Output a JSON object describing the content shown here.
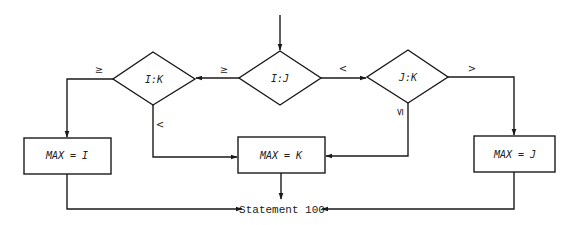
{
  "diagram": {
    "type": "flowchart",
    "decisions": [
      {
        "id": "ij",
        "label": "I:J"
      },
      {
        "id": "ik",
        "label": "I:K"
      },
      {
        "id": "jk",
        "label": "J:K"
      }
    ],
    "processes": [
      {
        "id": "max_i",
        "label": "MAX = I"
      },
      {
        "id": "max_k",
        "label": "MAX = K"
      },
      {
        "id": "max_j",
        "label": "MAX = J"
      }
    ],
    "terminal": {
      "id": "stmt100",
      "label": "Statement 100"
    },
    "edge_labels": {
      "ij_to_ik": "≥",
      "ij_to_jk": "<",
      "ik_to_max_i": "≥",
      "ik_to_max_k": "<",
      "jk_to_max_j": ">",
      "jk_to_max_k": "≤"
    },
    "edges": [
      {
        "from": "entry",
        "to": "ij"
      },
      {
        "from": "ij",
        "to": "ik",
        "label": "≥"
      },
      {
        "from": "ij",
        "to": "jk",
        "label": "<"
      },
      {
        "from": "ik",
        "to": "max_i",
        "label": "≥"
      },
      {
        "from": "ik",
        "to": "max_k",
        "label": "<"
      },
      {
        "from": "jk",
        "to": "max_j",
        "label": ">"
      },
      {
        "from": "jk",
        "to": "max_k",
        "label": "≤"
      },
      {
        "from": "max_i",
        "to": "stmt100"
      },
      {
        "from": "max_k",
        "to": "stmt100"
      },
      {
        "from": "max_j",
        "to": "stmt100"
      }
    ],
    "colors": {
      "stroke": "#1a1a1a",
      "background": "#ffffff"
    }
  }
}
